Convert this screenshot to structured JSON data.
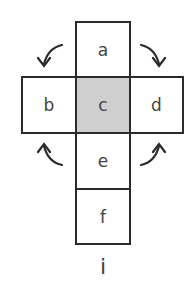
{
  "diagram": {
    "type": "cube-net",
    "faces": [
      {
        "id": "a",
        "label": "a",
        "shaded": false
      },
      {
        "id": "b",
        "label": "b",
        "shaded": false
      },
      {
        "id": "c",
        "label": "c",
        "shaded": true
      },
      {
        "id": "d",
        "label": "d",
        "shaded": false
      },
      {
        "id": "e",
        "label": "e",
        "shaded": false
      },
      {
        "id": "f",
        "label": "f",
        "shaded": false
      }
    ],
    "caption": "i",
    "colors": {
      "border": "#2b2b2b",
      "shaded": "#cfcfcf",
      "text": "#444444"
    },
    "arrows": [
      "fold-a-to-b",
      "fold-a-to-d",
      "fold-e-to-b",
      "fold-e-to-d"
    ]
  }
}
